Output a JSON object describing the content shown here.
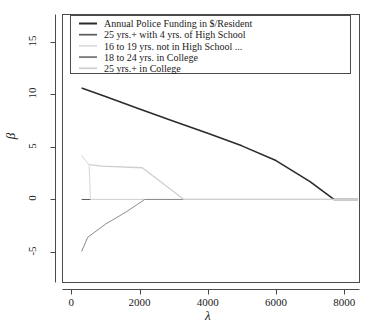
{
  "chart_data": {
    "type": "line",
    "title": "",
    "xlabel": "λ",
    "ylabel": "β",
    "xlim": [
      -260,
      8450
    ],
    "ylim": [
      -7.9,
      17.6
    ],
    "xticks": [
      0,
      2000,
      4000,
      6000,
      8000
    ],
    "xtick_labels": [
      "0",
      "2000",
      "4000",
      "6000",
      "8000"
    ],
    "yticks": [
      -5,
      0,
      5,
      10,
      15
    ],
    "ytick_labels": [
      "-5",
      "0",
      "5",
      "10",
      "15"
    ],
    "grid": false,
    "legend_position": "top",
    "zero_line": true,
    "series": [
      {
        "name": "Annual Police Funding in $/Resident",
        "color": "#2b2b2b",
        "width": 1.6,
        "x": [
          300,
          1000,
          2000,
          3000,
          4000,
          5000,
          6000,
          7000,
          7700,
          8400
        ],
        "y": [
          10.6,
          9.8,
          8.6,
          7.45,
          6.3,
          5.1,
          3.7,
          1.7,
          0.0,
          0.0
        ]
      },
      {
        "name": "25 yrs.+ with 4 yrs. of High School",
        "color": "#5a5a5a",
        "width": 1.0,
        "x": [
          300,
          8400
        ],
        "y": [
          0.0,
          0.0
        ]
      },
      {
        "name": "16 to 19 yrs. not in High School ...",
        "color": "#d8d8d8",
        "width": 1.0,
        "x": [
          300,
          520,
          560,
          8400
        ],
        "y": [
          4.2,
          3.3,
          0.0,
          0.0
        ]
      },
      {
        "name": "18 to 24 yrs. in College",
        "color": "#8c8c8c",
        "width": 1.0,
        "x": [
          300,
          480,
          1000,
          1600,
          2150,
          8400
        ],
        "y": [
          -4.95,
          -3.6,
          -2.35,
          -1.2,
          0.0,
          0.0
        ]
      },
      {
        "name": "25 yrs.+ in College",
        "color": "#cfcfcf",
        "width": 1.3,
        "x": [
          520,
          900,
          2080,
          3300,
          8400
        ],
        "y": [
          3.32,
          3.18,
          3.02,
          0.0,
          0.0
        ]
      }
    ]
  },
  "legend": {
    "entries": [
      {
        "label": "Annual Police Funding in $/Resident",
        "color": "#2b2b2b",
        "width": 2.0
      },
      {
        "label": "25 yrs.+ with 4 yrs. of High School",
        "color": "#5a5a5a",
        "width": 1.7
      },
      {
        "label": "16 to 19 yrs. not in High School ...",
        "color": "#d5d5d5",
        "width": 1.4
      },
      {
        "label": "18 to 24 yrs. in College",
        "color": "#7e7e7e",
        "width": 1.9
      },
      {
        "label": "25 yrs.+ in College",
        "color": "#cbcbcb",
        "width": 1.6
      }
    ]
  },
  "frame": {
    "border_color": "#4a4a4a"
  }
}
